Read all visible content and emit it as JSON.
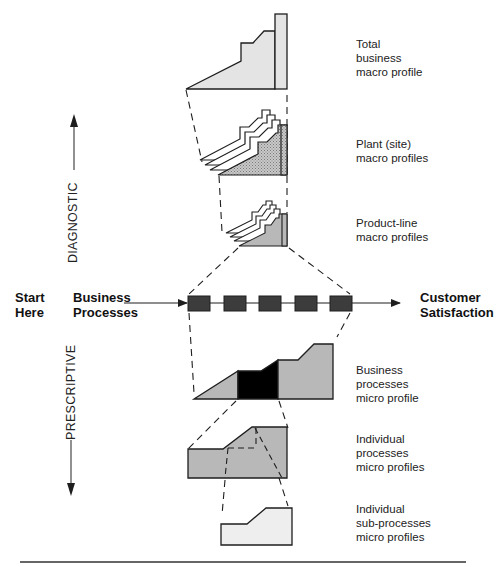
{
  "flow": {
    "start_label": "Start\nHere",
    "input_label": "Business\nProcesses",
    "output_label": "Customer\nSatisfaction",
    "process_box_count": 5
  },
  "axes": {
    "up_label": "DIAGNOSTIC",
    "down_label": "PRESCRIPTIVE"
  },
  "profiles": [
    {
      "id": "total-business",
      "label": "Total\nbusiness\nmacro profile",
      "level": "macro"
    },
    {
      "id": "plant-site",
      "label": "Plant (site)\nmacro profiles",
      "level": "macro"
    },
    {
      "id": "product-line",
      "label": "Product-line\nmacro profiles",
      "level": "macro"
    },
    {
      "id": "business-processes",
      "label": "Business\nprocesses\nmicro profile",
      "level": "micro"
    },
    {
      "id": "individual-processes",
      "label": "Individual\nprocesses\nmicro profiles",
      "level": "micro"
    },
    {
      "id": "individual-sub-processes",
      "label": "Individual\nsub-processes\nmicro profiles",
      "level": "micro"
    }
  ],
  "colors": {
    "light_fill": "#e4e4e4",
    "mid_fill": "#b8b8b8",
    "dark_fill": "#000000",
    "box_fill": "#3c3c3c",
    "stroke": "#1e1e1e"
  }
}
